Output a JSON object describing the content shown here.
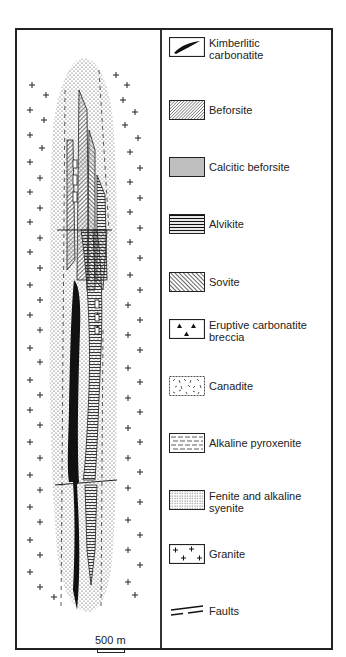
{
  "figure": {
    "type": "geological map",
    "scale_label": "500 m"
  },
  "legend": {
    "items": [
      {
        "id": "kimberlitic-carbonatite",
        "label_line1": "Kimberlitic",
        "label_line2": "carbonatite",
        "pattern": "solid-black-lens"
      },
      {
        "id": "beforsite",
        "label_line1": "Beforsite",
        "label_line2": "",
        "pattern": "diagonal-fine-hatch"
      },
      {
        "id": "calcitic-beforsite",
        "label_line1": "Calcitic beforsite",
        "label_line2": "",
        "pattern": "horizontal-fine-lines"
      },
      {
        "id": "alvikite",
        "label_line1": "Alvikite",
        "label_line2": "",
        "pattern": "horizontal-bold-lines"
      },
      {
        "id": "sovite",
        "label_line1": "Sovite",
        "label_line2": "",
        "pattern": "diagonal-bold-hatch"
      },
      {
        "id": "eruptive-carbonatite-breccia",
        "label_line1": "Eruptive carbonatite",
        "label_line2": "breccia",
        "pattern": "triangles"
      },
      {
        "id": "canadite",
        "label_line1": "Canadite",
        "label_line2": "",
        "pattern": "random-dashes"
      },
      {
        "id": "alkaline-pyroxenite",
        "label_line1": "Alkaline pyroxenite",
        "label_line2": "",
        "pattern": "dashed-horizontal"
      },
      {
        "id": "fenite-alkaline-syenite",
        "label_line1": "Fenite and alkaline",
        "label_line2": "syenite",
        "pattern": "stipple"
      },
      {
        "id": "granite",
        "label_line1": "Granite",
        "label_line2": "",
        "pattern": "crosses"
      },
      {
        "id": "faults",
        "label_line1": "Faults",
        "label_line2": "",
        "pattern": "double-line"
      }
    ]
  },
  "colors": {
    "ink": "#1a1a1a",
    "paper": "#ffffff"
  }
}
